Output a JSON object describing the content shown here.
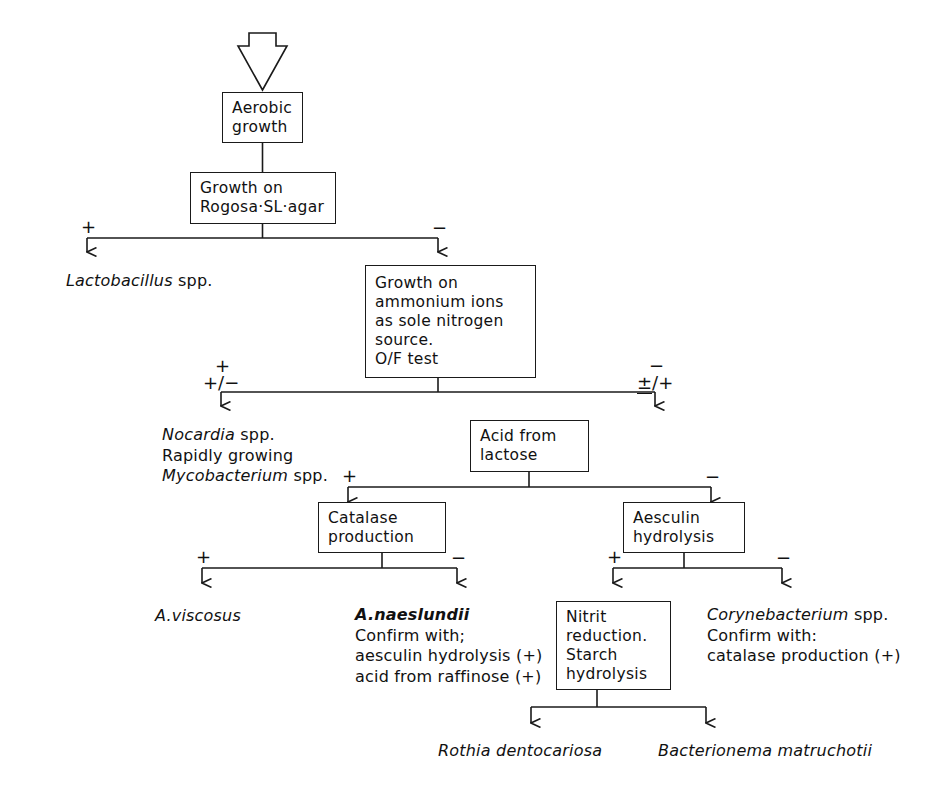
{
  "diagram": {
    "type": "flowchart",
    "entry_arrow": "down-block-arrow"
  },
  "boxes": {
    "aerobic_growth": {
      "lines": [
        "Aerobic",
        "growth"
      ]
    },
    "rogosa": {
      "lines": [
        "Growth on",
        "Rogosa·SL·agar"
      ]
    },
    "ammonium": {
      "lines": [
        "Growth on",
        "ammonium ions",
        "as sole nitrogen",
        "source.",
        "O/F test"
      ]
    },
    "acid_lactose": {
      "lines": [
        "Acid from",
        "lactose"
      ]
    },
    "catalase": {
      "lines": [
        "Catalase",
        "production"
      ]
    },
    "aesculin": {
      "lines": [
        "Aesculin",
        "hydrolysis"
      ]
    },
    "nitrit": {
      "lines": [
        "Nitrit",
        "reduction.",
        "Starch",
        "hydrolysis"
      ]
    }
  },
  "signs": {
    "rogosa_plus": "+",
    "rogosa_minus": "−",
    "ammonium_left_top": "+",
    "ammonium_left_bottom": "+/−",
    "ammonium_right_top": "−",
    "ammonium_right_bottom_a": "±",
    "ammonium_right_bottom_b": "/+",
    "lactose_plus": "+",
    "lactose_minus": "−",
    "catalase_plus": "+",
    "catalase_minus": "−",
    "aesculin_plus": "+",
    "aesculin_minus": "−"
  },
  "outcomes": {
    "lactobacillus": {
      "genus": "Lactobacillus",
      "rest": " spp."
    },
    "nocardia_group": {
      "line1_italic": "Nocardia",
      "line1_rest": " spp.",
      "line2": "Rapidly growing",
      "line3_italic": "Mycobacterium",
      "line3_rest": " spp."
    },
    "a_viscosus": {
      "name": "A.viscosus"
    },
    "a_naeslundii": {
      "name": "A.naeslundii",
      "line2": "Confirm with;",
      "line3": "aesculin hydrolysis (+)",
      "line4": "acid from raffinose (+)"
    },
    "corynebacterium": {
      "genus": "Corynebacterium",
      "genus_rest": " spp.",
      "line2": "Confirm with:",
      "line3": "catalase production (+)"
    },
    "rothia": {
      "name": "Rothia dentocariosa"
    },
    "bacterionema": {
      "name": "Bacterionema matruchotii"
    }
  },
  "colors": {
    "ink": "#1a1a1a",
    "background": "#ffffff"
  }
}
